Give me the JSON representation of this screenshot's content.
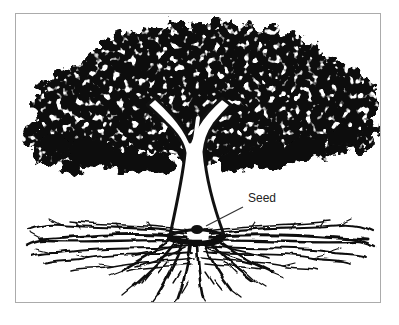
{
  "figure": {
    "label_seed": "Seed",
    "alt": "Black and white illustration of a mature tree with a broad stippled canopy, a white forked trunk, and a wide tangle of roots; a leader line points to the seed at the base of the trunk",
    "colors": {
      "ink": "#111111",
      "background": "#ffffff",
      "frame_border": "#ababab",
      "label_text": "#222222",
      "leader": "#333333"
    }
  }
}
